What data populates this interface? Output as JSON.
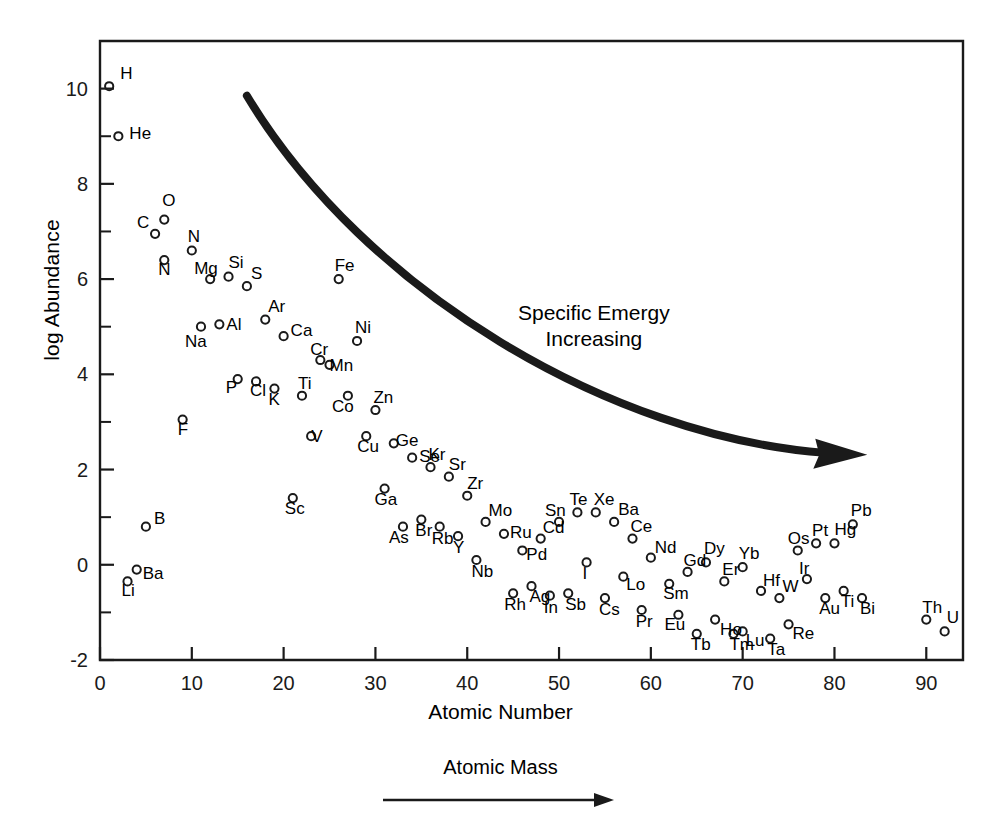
{
  "figure": {
    "background": "#ffffff",
    "ink": "#1a1a1a",
    "frame": {
      "left": 100,
      "top": 41,
      "right": 963,
      "bottom": 660
    }
  },
  "axes": {
    "ylabel": "log Abundance",
    "xlabel": "Atomic Number",
    "secondary_label": "Atomic Mass",
    "x_ticks": [
      "0",
      "10",
      "20",
      "30",
      "40",
      "50",
      "60",
      "70",
      "80",
      "90"
    ],
    "y_ticks": [
      "-2",
      "0",
      "2",
      "4",
      "6",
      "8",
      "10"
    ]
  },
  "annotation": {
    "line1": "Specific Emergy",
    "line2": "Increasing"
  },
  "chart_data": {
    "type": "scatter",
    "title": "",
    "xlabel": "Atomic Number",
    "ylabel": "log Abundance",
    "xlim": [
      0,
      94
    ],
    "ylim": [
      -2,
      11
    ],
    "grid": false,
    "legend": null,
    "annotations": [
      {
        "text": "Specific Emergy Increasing",
        "x": 57,
        "y": 5.1
      },
      {
        "text": "Atomic Mass",
        "x": 47,
        "y": -3.6,
        "arrow": "right"
      }
    ],
    "curve": {
      "description": "thick curved arrow sweeping from upper-left to lower-right, pointing right",
      "start": [
        16,
        9.85
      ],
      "end": [
        79,
        2.35
      ]
    },
    "points": [
      {
        "label": "H",
        "x": 1,
        "y": 10.05,
        "label_dx": 11,
        "label_dy": -13
      },
      {
        "label": "He",
        "x": 2,
        "y": 9.0,
        "label_dx": 11,
        "label_dy": -3
      },
      {
        "label": "Li",
        "x": 3,
        "y": -0.35,
        "label_dx": -6,
        "label_dy": 9
      },
      {
        "label": "Ba",
        "x": 4,
        "y": -0.1,
        "label_dx": 6,
        "label_dy": 3
      },
      {
        "label": "B",
        "x": 5,
        "y": 0.8,
        "label_dx": 8,
        "label_dy": -9
      },
      {
        "label": "C",
        "x": 6,
        "y": 6.95,
        "label_dx": -18,
        "label_dy": -12
      },
      {
        "label": "O",
        "x": 7,
        "y": 7.25,
        "label_dx": -2,
        "label_dy": -20
      },
      {
        "label": "N",
        "x": 7,
        "y": 6.4,
        "label_dx": -6,
        "label_dy": 9
      },
      {
        "label": "N",
        "x": 10,
        "y": 6.6,
        "label_dx": -4,
        "label_dy": -15
      },
      {
        "label": "F",
        "x": 9,
        "y": 3.05,
        "label_dx": -5,
        "label_dy": 9
      },
      {
        "label": "Na",
        "x": 11,
        "y": 5.0,
        "label_dx": -16,
        "label_dy": 14
      },
      {
        "label": "Mg",
        "x": 12,
        "y": 6.0,
        "label_dx": -16,
        "label_dy": -11
      },
      {
        "label": "Al",
        "x": 13,
        "y": 5.05,
        "label_dx": 7,
        "label_dy": 0
      },
      {
        "label": "Si",
        "x": 14,
        "y": 6.05,
        "label_dx": 0,
        "label_dy": -15
      },
      {
        "label": "P",
        "x": 15,
        "y": 3.9,
        "label_dx": -12,
        "label_dy": 8
      },
      {
        "label": "S",
        "x": 16,
        "y": 5.85,
        "label_dx": 4,
        "label_dy": -13
      },
      {
        "label": "Cl",
        "x": 17,
        "y": 3.85,
        "label_dx": -6,
        "label_dy": 9
      },
      {
        "label": "Ar",
        "x": 18,
        "y": 5.15,
        "label_dx": 3,
        "label_dy": -14
      },
      {
        "label": "K",
        "x": 19,
        "y": 3.7,
        "label_dx": -6,
        "label_dy": 10
      },
      {
        "label": "Ca",
        "x": 20,
        "y": 4.8,
        "label_dx": 7,
        "label_dy": -6
      },
      {
        "label": "Sc",
        "x": 21,
        "y": 1.4,
        "label_dx": -8,
        "label_dy": 10
      },
      {
        "label": "Ti",
        "x": 22,
        "y": 3.55,
        "label_dx": -4,
        "label_dy": -13
      },
      {
        "label": "V",
        "x": 23,
        "y": 2.7,
        "label_dx": 0,
        "label_dy": 0
      },
      {
        "label": "Cr",
        "x": 24,
        "y": 4.3,
        "label_dx": -10,
        "label_dy": -11
      },
      {
        "label": "Mn",
        "x": 25,
        "y": 4.2,
        "label_dx": 0,
        "label_dy": 0
      },
      {
        "label": "Fe",
        "x": 26,
        "y": 6.0,
        "label_dx": -4,
        "label_dy": -14
      },
      {
        "label": "Co",
        "x": 27,
        "y": 3.55,
        "label_dx": -16,
        "label_dy": 10
      },
      {
        "label": "Ni",
        "x": 28,
        "y": 4.7,
        "label_dx": -2,
        "label_dy": -14
      },
      {
        "label": "Cu",
        "x": 29,
        "y": 2.7,
        "label_dx": -9,
        "label_dy": 10
      },
      {
        "label": "Zn",
        "x": 30,
        "y": 3.25,
        "label_dx": -2,
        "label_dy": -13
      },
      {
        "label": "Ga",
        "x": 31,
        "y": 1.6,
        "label_dx": -10,
        "label_dy": 10
      },
      {
        "label": "Ge",
        "x": 32,
        "y": 2.55,
        "label_dx": 2,
        "label_dy": -3
      },
      {
        "label": "As",
        "x": 33,
        "y": 0.8,
        "label_dx": -14,
        "label_dy": 10
      },
      {
        "label": "Se",
        "x": 34,
        "y": 2.25,
        "label_dx": 7,
        "label_dy": -2
      },
      {
        "label": "Br",
        "x": 35,
        "y": 0.95,
        "label_dx": -6,
        "label_dy": 10
      },
      {
        "label": "Kr",
        "x": 36,
        "y": 2.05,
        "label_dx": -2,
        "label_dy": -13
      },
      {
        "label": "Rb",
        "x": 37,
        "y": 0.8,
        "label_dx": -8,
        "label_dy": 11
      },
      {
        "label": "Sr",
        "x": 38,
        "y": 1.85,
        "label_dx": 0,
        "label_dy": -13
      },
      {
        "label": "Y",
        "x": 39,
        "y": 0.6,
        "label_dx": -5,
        "label_dy": 11
      },
      {
        "label": "Zr",
        "x": 40,
        "y": 1.45,
        "label_dx": 0,
        "label_dy": -13
      },
      {
        "label": "Nb",
        "x": 41,
        "y": 0.1,
        "label_dx": -5,
        "label_dy": 11
      },
      {
        "label": "Mo",
        "x": 42,
        "y": 0.9,
        "label_dx": 3,
        "label_dy": -12
      },
      {
        "label": "Ru",
        "x": 44,
        "y": 0.65,
        "label_dx": 6,
        "label_dy": -2
      },
      {
        "label": "Rh",
        "x": 45,
        "y": -0.6,
        "label_dx": -9,
        "label_dy": 11
      },
      {
        "label": "Pd",
        "x": 46,
        "y": 0.3,
        "label_dx": 4,
        "label_dy": 4
      },
      {
        "label": "Ag",
        "x": 47,
        "y": -0.45,
        "label_dx": -2,
        "label_dy": 10
      },
      {
        "label": "Cd",
        "x": 48,
        "y": 0.55,
        "label_dx": 2,
        "label_dy": -12
      },
      {
        "label": "In",
        "x": 49,
        "y": -0.65,
        "label_dx": -6,
        "label_dy": 11
      },
      {
        "label": "Sn",
        "x": 50,
        "y": 0.9,
        "label_dx": -14,
        "label_dy": -12
      },
      {
        "label": "Sb",
        "x": 51,
        "y": -0.6,
        "label_dx": -3,
        "label_dy": 11
      },
      {
        "label": "Te",
        "x": 52,
        "y": 1.1,
        "label_dx": -8,
        "label_dy": -13
      },
      {
        "label": "I",
        "x": 53,
        "y": 0.05,
        "label_dx": -4,
        "label_dy": 11
      },
      {
        "label": "Xe",
        "x": 54,
        "y": 1.1,
        "label_dx": -2,
        "label_dy": -13
      },
      {
        "label": "Cs",
        "x": 55,
        "y": -0.7,
        "label_dx": -6,
        "label_dy": 11
      },
      {
        "label": "Ba",
        "x": 56,
        "y": 0.9,
        "label_dx": 4,
        "label_dy": -13
      },
      {
        "label": "Lo",
        "x": 57,
        "y": -0.25,
        "label_dx": 3,
        "label_dy": 7
      },
      {
        "label": "Ce",
        "x": 58,
        "y": 0.55,
        "label_dx": -2,
        "label_dy": -13
      },
      {
        "label": "Pr",
        "x": 59,
        "y": -0.95,
        "label_dx": -6,
        "label_dy": 11
      },
      {
        "label": "Nd",
        "x": 60,
        "y": 0.15,
        "label_dx": 4,
        "label_dy": -11
      },
      {
        "label": "Sm",
        "x": 62,
        "y": -0.4,
        "label_dx": -6,
        "label_dy": 9
      },
      {
        "label": "Eu",
        "x": 63,
        "y": -1.05,
        "label_dx": -14,
        "label_dy": 9
      },
      {
        "label": "Gd",
        "x": 64,
        "y": -0.15,
        "label_dx": -4,
        "label_dy": -12
      },
      {
        "label": "Tb",
        "x": 65,
        "y": -1.45,
        "label_dx": -6,
        "label_dy": 10
      },
      {
        "label": "Dy",
        "x": 66,
        "y": 0.05,
        "label_dx": -2,
        "label_dy": -14
      },
      {
        "label": "Ho",
        "x": 67,
        "y": -1.15,
        "label_dx": 5,
        "label_dy": 9
      },
      {
        "label": "Er",
        "x": 68,
        "y": -0.35,
        "label_dx": -2,
        "label_dy": -12
      },
      {
        "label": "Tm",
        "x": 69,
        "y": -1.45,
        "label_dx": -4,
        "label_dy": 10
      },
      {
        "label": "Yb",
        "x": 70,
        "y": -0.05,
        "label_dx": -4,
        "label_dy": -14
      },
      {
        "label": "Lu",
        "x": 70,
        "y": -1.4,
        "label_dx": 3,
        "label_dy": 9
      },
      {
        "label": "Hf",
        "x": 72,
        "y": -0.55,
        "label_dx": 2,
        "label_dy": -11
      },
      {
        "label": "Ta",
        "x": 73,
        "y": -1.55,
        "label_dx": -3,
        "label_dy": 10
      },
      {
        "label": "W",
        "x": 74,
        "y": -0.7,
        "label_dx": 3,
        "label_dy": -12
      },
      {
        "label": "Re",
        "x": 75,
        "y": -1.25,
        "label_dx": 4,
        "label_dy": 9
      },
      {
        "label": "Os",
        "x": 76,
        "y": 0.3,
        "label_dx": -10,
        "label_dy": -12
      },
      {
        "label": "Ir",
        "x": 77,
        "y": -0.3,
        "label_dx": -8,
        "label_dy": -11
      },
      {
        "label": "Pt",
        "x": 78,
        "y": 0.45,
        "label_dx": -4,
        "label_dy": -13
      },
      {
        "label": "Au",
        "x": 79,
        "y": -0.7,
        "label_dx": -6,
        "label_dy": 10
      },
      {
        "label": "Hg",
        "x": 80,
        "y": 0.45,
        "label_dx": 0,
        "label_dy": -14
      },
      {
        "label": "Ti",
        "x": 81,
        "y": -0.55,
        "label_dx": -3,
        "label_dy": 10
      },
      {
        "label": "Pb",
        "x": 82,
        "y": 0.85,
        "label_dx": -2,
        "label_dy": -14
      },
      {
        "label": "Bi",
        "x": 83,
        "y": -0.7,
        "label_dx": -2,
        "label_dy": 10
      },
      {
        "label": "Th",
        "x": 90,
        "y": -1.15,
        "label_dx": -4,
        "label_dy": -13
      },
      {
        "label": "U",
        "x": 92,
        "y": -1.4,
        "label_dx": 2,
        "label_dy": -14
      }
    ]
  }
}
